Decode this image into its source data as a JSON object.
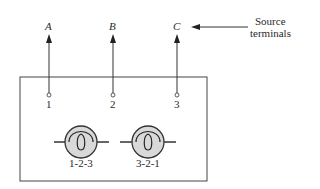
{
  "diagram": {
    "source_terminals": [
      {
        "label": "A",
        "x": 49
      },
      {
        "label": "B",
        "x": 113
      },
      {
        "label": "C",
        "x": 177
      }
    ],
    "box_terminals": [
      {
        "label": "1",
        "x": 49
      },
      {
        "label": "2",
        "x": 113
      },
      {
        "label": "3",
        "x": 177
      }
    ],
    "lamps": [
      {
        "label": "1-2-3",
        "cx": 81
      },
      {
        "label": "3-2-1",
        "cx": 148
      }
    ],
    "annotation": {
      "line1": "Source",
      "line2": "terminals"
    },
    "colors": {
      "stroke": "#333333",
      "lamp_fill": "#d9d9d9"
    }
  }
}
